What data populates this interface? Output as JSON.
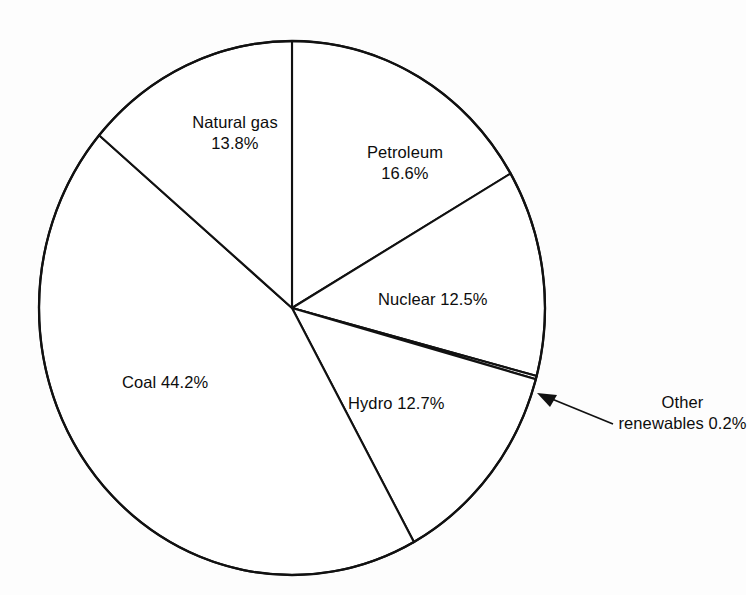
{
  "chart_data": {
    "type": "pie",
    "title": "",
    "subtitle": "",
    "xlabel": "",
    "ylabel": "",
    "legend": "none",
    "grid": false,
    "units": "percent",
    "start_angle_deg": 0,
    "direction": "clockwise",
    "categories": [
      "Petroleum",
      "Nuclear",
      "Other renewables",
      "Hydro",
      "Coal",
      "Natural gas"
    ],
    "values": [
      16.6,
      12.5,
      0.2,
      12.7,
      44.2,
      13.8
    ],
    "slices": [
      {
        "name": "Petroleum",
        "value": 16.6,
        "label_text": "Petroleum\n16.6%",
        "label_placement": "inside",
        "callout": false
      },
      {
        "name": "Nuclear",
        "value": 12.5,
        "label_text": "Nuclear 12.5%",
        "label_placement": "inside",
        "callout": false
      },
      {
        "name": "Other renewables",
        "value": 0.2,
        "label_text": "Other\nrenewables 0.2%",
        "label_placement": "outside",
        "callout": true
      },
      {
        "name": "Hydro",
        "value": 12.7,
        "label_text": "Hydro 12.7%",
        "label_placement": "inside",
        "callout": false
      },
      {
        "name": "Coal",
        "value": 44.2,
        "label_text": "Coal 44.2%",
        "label_placement": "inside",
        "callout": false
      },
      {
        "name": "Natural gas",
        "value": 13.8,
        "label_text": "Natural gas\n13.8%",
        "label_placement": "inside",
        "callout": false
      }
    ],
    "colors": {
      "slice_fill": "#ffffff",
      "slice_stroke": "#111111",
      "text": "#0d0d0d",
      "background": "#fdfdfd"
    }
  },
  "labels": {
    "natural_gas": "Natural gas\n13.8%",
    "petroleum": "Petroleum\n16.6%",
    "nuclear": "Nuclear 12.5%",
    "coal": "Coal 44.2%",
    "hydro": "Hydro 12.7%",
    "other_renewables": "Other\nrenewables 0.2%"
  }
}
